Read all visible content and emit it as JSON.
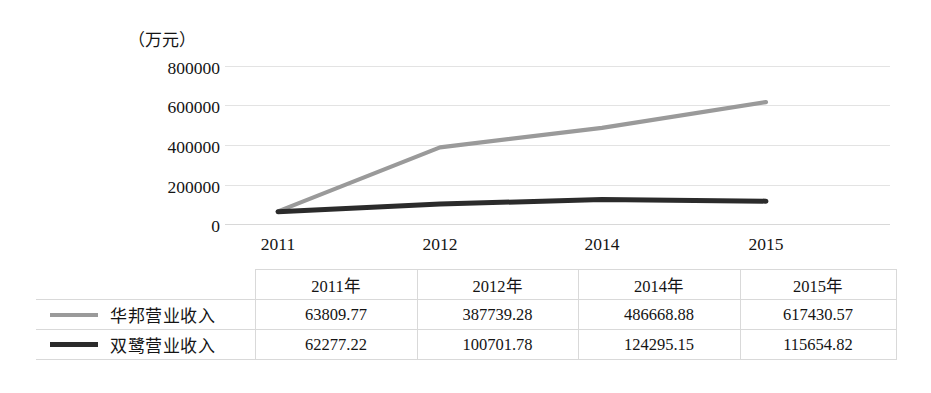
{
  "chart_data": {
    "type": "line",
    "title": "",
    "unit_label": "（万元）",
    "xlabel": "",
    "ylabel": "",
    "categories": [
      "2011",
      "2012",
      "2014",
      "2015"
    ],
    "ylim": [
      0,
      800000
    ],
    "yticks": [
      0,
      200000,
      400000,
      600000,
      800000
    ],
    "ytick_labels": [
      "0",
      "200000",
      "400000",
      "600000",
      "800000"
    ],
    "grid": true,
    "legend_position": "table-row-headers",
    "series": [
      {
        "name": "华邦营业收入",
        "color": "#9a9a9a",
        "values": [
          63809.77,
          387739.28,
          486668.88,
          617430.57
        ]
      },
      {
        "name": "双鹭营业收入",
        "color": "#2b2b2b",
        "values": [
          62277.22,
          100701.78,
          124295.15,
          115654.82
        ]
      }
    ]
  },
  "table": {
    "corner_label": "",
    "columns": [
      "2011年",
      "2012年",
      "2014年",
      "2015年"
    ],
    "rows": [
      {
        "label": "华邦营业收入",
        "swatch": "gray",
        "values": [
          "63809.77",
          "387739.28",
          "486668.88",
          "617430.57"
        ]
      },
      {
        "label": "双鹭营业收入",
        "swatch": "black",
        "values": [
          "62277.22",
          "100701.78",
          "124295.15",
          "115654.82"
        ]
      }
    ]
  },
  "colors": {
    "series_gray": "#9a9a9a",
    "series_black": "#2b2b2b",
    "gridline": "#e3e3e3",
    "table_border": "#d9d9d9",
    "text": "#141414"
  }
}
